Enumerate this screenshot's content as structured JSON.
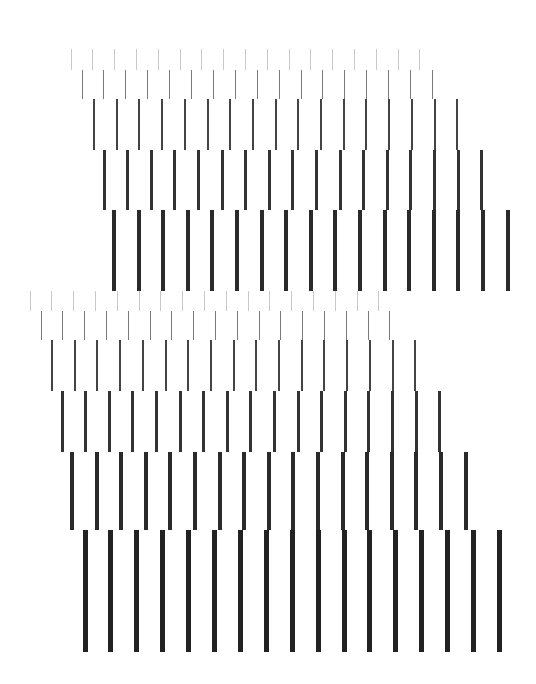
{
  "canvas": {
    "width": 536,
    "height": 684,
    "background": "#ffffff"
  },
  "groups": [
    {
      "name": "upper-bar-cascade",
      "rows": [
        {
          "top": 49,
          "height": 21,
          "x0": 71,
          "spacing": 21.8,
          "count": 17,
          "width": 1,
          "color": "#c8c8c8"
        },
        {
          "top": 70,
          "height": 29,
          "x0": 82,
          "spacing": 21.9,
          "count": 17,
          "width": 1,
          "color": "#7a7a7a"
        },
        {
          "top": 99,
          "height": 51,
          "x0": 94,
          "spacing": 22.7,
          "count": 17,
          "width": 2,
          "color": "#444444"
        },
        {
          "top": 150,
          "height": 60,
          "x0": 104,
          "spacing": 23.6,
          "count": 17,
          "width": 3,
          "color": "#333333"
        },
        {
          "top": 210,
          "height": 81,
          "x0": 114,
          "spacing": 24.6,
          "count": 17,
          "width": 4,
          "color": "#2a2a2a"
        }
      ]
    },
    {
      "name": "lower-bar-cascade",
      "rows": [
        {
          "top": 291,
          "height": 20,
          "x0": 30,
          "spacing": 21.8,
          "count": 17,
          "width": 1,
          "color": "#c8c8c8"
        },
        {
          "top": 311,
          "height": 29,
          "x0": 41,
          "spacing": 21.8,
          "count": 17,
          "width": 1,
          "color": "#7a7a7a"
        },
        {
          "top": 340,
          "height": 51,
          "x0": 52,
          "spacing": 22.7,
          "count": 17,
          "width": 2,
          "color": "#444444"
        },
        {
          "top": 391,
          "height": 61,
          "x0": 62,
          "spacing": 23.6,
          "count": 17,
          "width": 3,
          "color": "#333333"
        },
        {
          "top": 452,
          "height": 78,
          "x0": 72,
          "spacing": 24.6,
          "count": 17,
          "width": 4,
          "color": "#2a2a2a"
        },
        {
          "top": 530,
          "height": 122,
          "x0": 85,
          "spacing": 25.9,
          "count": 17,
          "width": 5,
          "color": "#222222"
        }
      ]
    }
  ]
}
